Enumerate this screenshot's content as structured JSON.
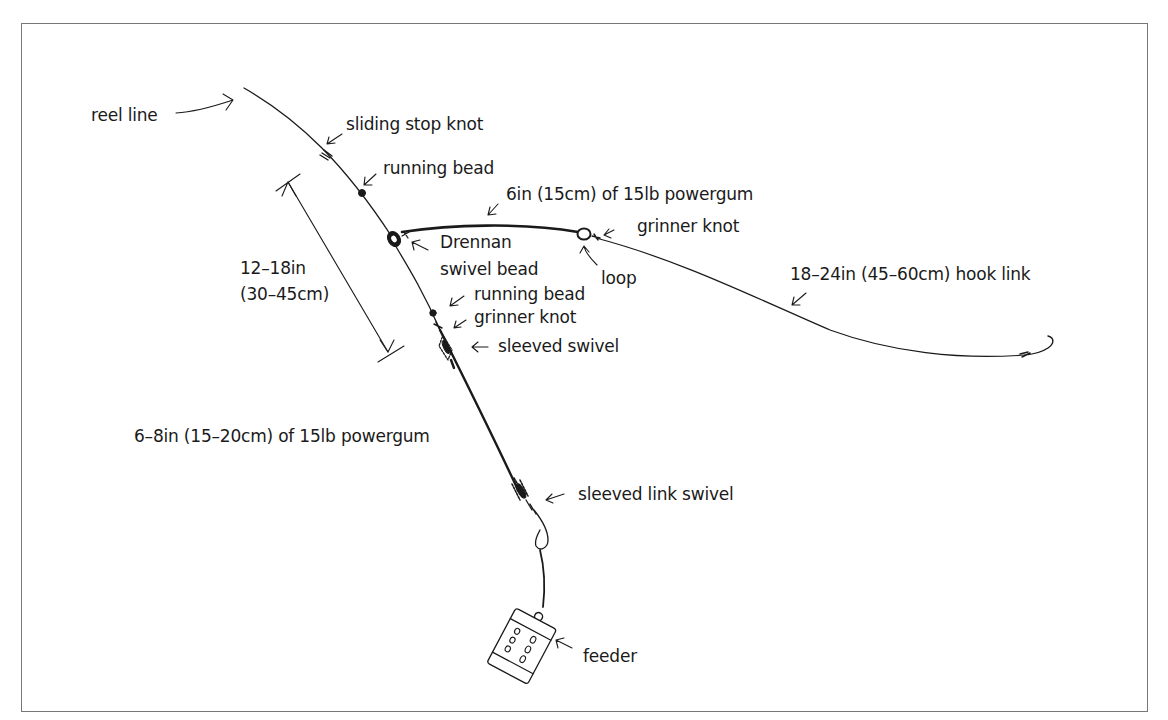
{
  "diagram": {
    "labels": {
      "reel_line": "reel line",
      "sliding_stop_knot": "sliding stop knot",
      "running_bead_top": "running bead",
      "powergum_top": "6in (15cm) of 15lb powergum",
      "grinner_knot_top": "grinner knot",
      "drennan_line1": "Drennan",
      "drennan_line2": "swivel bead",
      "loop": "loop",
      "hook_link": "18–24in (45–60cm) hook link",
      "length_line1": "12–18in",
      "length_line2": "(30–45cm)",
      "running_bead_lower": "running bead",
      "grinner_knot_lower": "grinner knot",
      "sleeved_swivel": "sleeved swivel",
      "powergum_lower": "6–8in (15–20cm) of 15lb powergum",
      "sleeved_link_swivel": "sleeved link swivel",
      "feeder": "feeder"
    },
    "components": [
      "reel-line",
      "sliding-stop-knot",
      "running-bead",
      "drennan-swivel-bead",
      "powergum-link",
      "loop",
      "grinner-knot",
      "hook-link",
      "hook",
      "running-bead-lower",
      "grinner-knot-lower",
      "sleeved-swivel",
      "powergum-lower",
      "sleeved-link-swivel",
      "feeder"
    ],
    "colors": {
      "ink": "#1a1a1a",
      "frame": "#777777",
      "background": "#ffffff"
    }
  }
}
